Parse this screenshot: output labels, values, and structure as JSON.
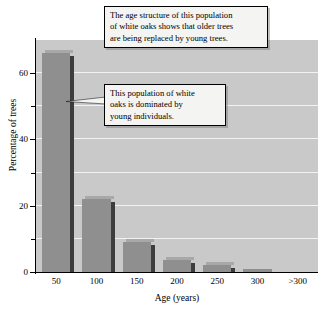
{
  "chart_data": {
    "type": "bar",
    "title": "",
    "xlabel": "Age (years)",
    "ylabel": "Percentage of trees",
    "categories": [
      "50",
      "100",
      "150",
      "200",
      "250",
      "300",
      ">300"
    ],
    "values": [
      66,
      22,
      9,
      3.5,
      2,
      1,
      0
    ],
    "ylim": [
      0,
      70
    ],
    "yticks_major": [
      0,
      20,
      40,
      60
    ],
    "yticks_minor": [
      10,
      30,
      50
    ],
    "ytick_labels": [
      "0",
      "20",
      "40",
      "60"
    ],
    "grid": "horizontal-white-every-10",
    "legend": "none",
    "bar_color": "#8f8f8f",
    "plot_background": "#c9c9c9",
    "annotations": [
      "The age structure of this population of white oaks shows that older trees are being replaced by young trees.",
      "This population of white oaks is dominated by young individuals."
    ]
  },
  "callouts": {
    "top": {
      "line1": "The age structure of this population",
      "line2": "of white oaks shows that older trees",
      "line3": "are being replaced by young trees."
    },
    "middle": {
      "line1": "This population of white",
      "line2": "oaks is dominated by",
      "line3": "young individuals."
    }
  },
  "axes": {
    "x_title": "Age (years)",
    "y_title": "Percentage of trees",
    "x_labels": [
      "50",
      "100",
      "150",
      "200",
      "250",
      "300",
      ">300"
    ],
    "y_labels": [
      "0",
      "20",
      "40",
      "60"
    ]
  },
  "colors": {
    "bar": "#8f8f8f",
    "bar_side": "#3d3d3d",
    "plot_bg": "#c9c9c9",
    "gridline": "#f2f2f2",
    "callout_bg": "#f4f4f2",
    "axis": "#000000"
  }
}
